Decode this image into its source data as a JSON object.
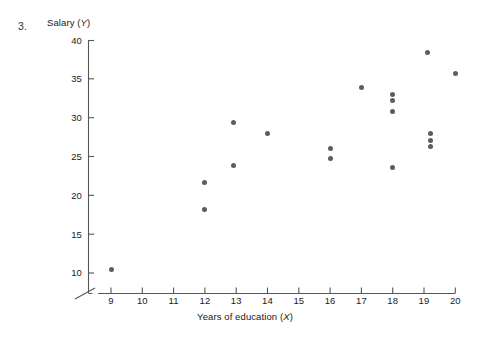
{
  "figure": {
    "item_number": "3.",
    "y_axis_title_prefix": "Salary (",
    "y_axis_title_var": "Y",
    "y_axis_title_suffix": ")",
    "x_axis_title_prefix": "Years of education (",
    "x_axis_title_var": "X",
    "x_axis_title_suffix": ")",
    "point_color": "#5d5d5d",
    "axis_color": "#555555"
  },
  "chart_data": {
    "type": "scatter",
    "title": "",
    "xlabel": "Years of education (X)",
    "ylabel": "Salary (Y)",
    "xlim": [
      8.3,
      20.4
    ],
    "ylim": [
      9.0,
      40.5
    ],
    "xticks": [
      9,
      10,
      11,
      12,
      13,
      14,
      15,
      16,
      17,
      18,
      19,
      20
    ],
    "yticks": [
      10,
      15,
      20,
      25,
      30,
      35,
      40
    ],
    "xtick_labels": [
      "9",
      "10",
      "11",
      "12",
      "13",
      "14",
      "15",
      "16",
      "17",
      "18",
      "19",
      "20"
    ],
    "ytick_labels": [
      "10",
      "15",
      "20",
      "25",
      "30",
      "35",
      "40"
    ],
    "grid": false,
    "legend": null,
    "axis_break": true,
    "points": [
      {
        "x": 9.0,
        "y": 10.5
      },
      {
        "x": 12.0,
        "y": 21.7
      },
      {
        "x": 12.0,
        "y": 18.2
      },
      {
        "x": 12.9,
        "y": 29.4
      },
      {
        "x": 12.9,
        "y": 23.9
      },
      {
        "x": 14.0,
        "y": 28.0
      },
      {
        "x": 16.0,
        "y": 26.1
      },
      {
        "x": 16.0,
        "y": 24.8
      },
      {
        "x": 17.0,
        "y": 34.0
      },
      {
        "x": 18.0,
        "y": 33.0
      },
      {
        "x": 18.0,
        "y": 32.3
      },
      {
        "x": 18.0,
        "y": 30.8
      },
      {
        "x": 18.0,
        "y": 23.6
      },
      {
        "x": 19.2,
        "y": 28.0
      },
      {
        "x": 19.2,
        "y": 27.1
      },
      {
        "x": 19.2,
        "y": 26.3
      },
      {
        "x": 19.1,
        "y": 38.5
      },
      {
        "x": 20.0,
        "y": 35.8
      }
    ]
  }
}
